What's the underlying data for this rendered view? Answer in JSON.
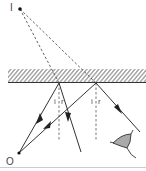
{
  "diagram": {
    "labels": {
      "image_point": "I",
      "object_point": "O",
      "incidence_angle_1": "i",
      "reflection_angle_1": "r",
      "incidence_angle_2": "i",
      "reflection_angle_2": "r"
    },
    "colors": {
      "line": "#333333",
      "dashed": "#555555",
      "mirror_hatch": "#444444",
      "baseline": "#cccccc",
      "eye_fill": "#888888"
    },
    "elements": [
      "mirror",
      "object-point-O",
      "image-point-I",
      "incident-ray-1",
      "incident-ray-2",
      "reflected-ray-1",
      "reflected-ray-2",
      "normal-1",
      "normal-2",
      "virtual-ray-1",
      "virtual-ray-2",
      "eye"
    ]
  }
}
